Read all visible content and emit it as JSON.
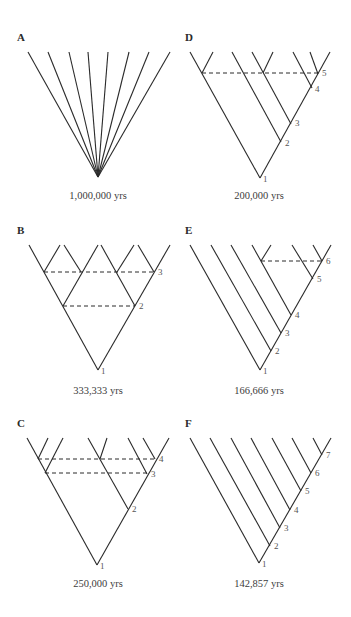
{
  "figure": {
    "panels": [
      {
        "id": "A",
        "letter": "A",
        "letter_pos": [
          17,
          31
        ],
        "caption": "1,000,000 yrs",
        "caption_pos": [
          98,
          190
        ],
        "branches": [
          [
            98,
            177,
            28,
            52
          ],
          [
            98,
            177,
            48,
            52
          ],
          [
            98,
            177,
            69,
            52
          ],
          [
            98,
            177,
            88,
            52
          ],
          [
            98,
            177,
            108,
            52
          ],
          [
            98,
            177,
            129,
            52
          ],
          [
            98,
            177,
            149,
            52
          ],
          [
            98,
            177,
            170,
            52
          ]
        ],
        "dashes": [],
        "node_labels": []
      },
      {
        "id": "D",
        "letter": "D",
        "letter_pos": [
          185,
          31
        ],
        "caption": "200,000 yrs",
        "caption_pos": [
          259,
          190
        ],
        "branches": [
          [
            260,
            178,
            190,
            52
          ],
          [
            260,
            178,
            330,
            52
          ],
          [
            202,
            73,
            213,
            52
          ],
          [
            281,
            142,
            232,
            52
          ],
          [
            291,
            124,
            252,
            52
          ],
          [
            263,
            73,
            273,
            52
          ],
          [
            312,
            88,
            293,
            52
          ],
          [
            318,
            74,
            310,
            52
          ]
        ],
        "dashes": [
          [
            202,
            73,
            318,
            73
          ]
        ],
        "node_labels": [
          {
            "text": "1",
            "x": 263,
            "y": 174
          },
          {
            "text": "2",
            "x": 285,
            "y": 138
          },
          {
            "text": "3",
            "x": 295,
            "y": 118
          },
          {
            "text": "4",
            "x": 315,
            "y": 84
          },
          {
            "text": "5",
            "x": 322,
            "y": 68
          }
        ]
      },
      {
        "id": "B",
        "letter": "B",
        "letter_pos": [
          17,
          224
        ],
        "caption": "333,333 yrs",
        "caption_pos": [
          98,
          385
        ],
        "branches": [
          [
            98,
            370,
            29,
            245
          ],
          [
            98,
            370,
            170,
            245
          ],
          [
            63,
            306,
            98,
            245
          ],
          [
            135,
            306,
            101,
            245
          ],
          [
            44,
            272,
            60,
            245
          ],
          [
            81,
            272,
            64,
            245
          ],
          [
            117,
            272,
            134,
            245
          ],
          [
            154,
            272,
            138,
            245
          ]
        ],
        "dashes": [
          [
            44,
            272,
            154,
            272
          ],
          [
            63,
            306,
            135,
            306
          ]
        ],
        "node_labels": [
          {
            "text": "1",
            "x": 101,
            "y": 366
          },
          {
            "text": "2",
            "x": 139,
            "y": 301
          },
          {
            "text": "3",
            "x": 158,
            "y": 267
          }
        ]
      },
      {
        "id": "E",
        "letter": "E",
        "letter_pos": [
          185,
          224
        ],
        "caption": "166,666 yrs",
        "caption_pos": [
          259,
          385
        ],
        "branches": [
          [
            260,
            370,
            190,
            245
          ],
          [
            260,
            370,
            331,
            245
          ],
          [
            271,
            351,
            211,
            245
          ],
          [
            281,
            333,
            231,
            245
          ],
          [
            291,
            315,
            252,
            245
          ],
          [
            261,
            261,
            271,
            245
          ],
          [
            313,
            279,
            292,
            245
          ],
          [
            322,
            261,
            313,
            245
          ]
        ],
        "dashes": [
          [
            261,
            261,
            322,
            261
          ]
        ],
        "node_labels": [
          {
            "text": "1",
            "x": 263,
            "y": 366
          },
          {
            "text": "2",
            "x": 275,
            "y": 346
          },
          {
            "text": "3",
            "x": 285,
            "y": 328
          },
          {
            "text": "4",
            "x": 295,
            "y": 310
          },
          {
            "text": "5",
            "x": 317,
            "y": 274
          },
          {
            "text": "6",
            "x": 326,
            "y": 256
          }
        ]
      },
      {
        "id": "C",
        "letter": "C",
        "letter_pos": [
          17,
          417
        ],
        "caption": "250,000 yrs",
        "caption_pos": [
          98,
          578
        ],
        "branches": [
          [
            97,
            565,
            27,
            438
          ],
          [
            97,
            565,
            169,
            438
          ],
          [
            128,
            509,
            88,
            438
          ],
          [
            100,
            459,
            107,
            438
          ],
          [
            45,
            473,
            63,
            438
          ],
          [
            38,
            459,
            48,
            438
          ],
          [
            147,
            474,
            128,
            438
          ],
          [
            155,
            459,
            143,
            438
          ]
        ],
        "dashes": [
          [
            38,
            459,
            155,
            459
          ],
          [
            45,
            473,
            147,
            473
          ]
        ],
        "node_labels": [
          {
            "text": "1",
            "x": 100,
            "y": 561
          },
          {
            "text": "2",
            "x": 132,
            "y": 504
          },
          {
            "text": "3",
            "x": 151,
            "y": 469
          },
          {
            "text": "4",
            "x": 159,
            "y": 454
          }
        ]
      },
      {
        "id": "F",
        "letter": "F",
        "letter_pos": [
          185,
          417
        ],
        "caption": "142,857 yrs",
        "caption_pos": [
          259,
          578
        ],
        "branches": [
          [
            259,
            563,
            190,
            438
          ],
          [
            259,
            563,
            331,
            438
          ],
          [
            270,
            546,
            210,
            438
          ],
          [
            280,
            528,
            231,
            438
          ],
          [
            290,
            510,
            251,
            438
          ],
          [
            301,
            491,
            272,
            438
          ],
          [
            311,
            473,
            292,
            438
          ],
          [
            322,
            455,
            313,
            438
          ]
        ],
        "dashes": [],
        "node_labels": [
          {
            "text": "1",
            "x": 262,
            "y": 559
          },
          {
            "text": "2",
            "x": 274,
            "y": 541
          },
          {
            "text": "3",
            "x": 284,
            "y": 523
          },
          {
            "text": "4",
            "x": 294,
            "y": 505
          },
          {
            "text": "5",
            "x": 305,
            "y": 486
          },
          {
            "text": "6",
            "x": 315,
            "y": 468
          },
          {
            "text": "7",
            "x": 326,
            "y": 450
          }
        ]
      }
    ]
  }
}
